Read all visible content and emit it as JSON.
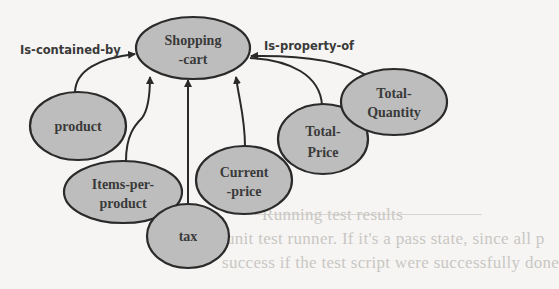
{
  "diagram": {
    "type": "concept-relationship-graph",
    "colors": {
      "node_fill": "#bdbdbd",
      "node_stroke": "#2a2a2a",
      "edge": "#2a2a2a",
      "text": "#3a3a3a",
      "background": "#f6f5f3"
    },
    "nodes": [
      {
        "id": "shopping-cart",
        "lines": [
          "Shopping",
          "-cart"
        ]
      },
      {
        "id": "product",
        "lines": [
          "product"
        ]
      },
      {
        "id": "items-per-product",
        "lines": [
          "Items-per-",
          "product"
        ]
      },
      {
        "id": "tax",
        "lines": [
          "tax"
        ]
      },
      {
        "id": "current-price",
        "lines": [
          "Current",
          "-price"
        ]
      },
      {
        "id": "total-price",
        "lines": [
          "Total-",
          "Price"
        ]
      },
      {
        "id": "total-quantity",
        "lines": [
          "Total-",
          "Quantity"
        ]
      }
    ],
    "edge_labels": {
      "left": "Is-contained-by",
      "right": "Is-property-of"
    },
    "edges": [
      {
        "from": "product",
        "to": "shopping-cart",
        "label": "Is-contained-by"
      },
      {
        "from": "items-per-product",
        "to": "shopping-cart"
      },
      {
        "from": "tax",
        "to": "shopping-cart"
      },
      {
        "from": "current-price",
        "to": "shopping-cart"
      },
      {
        "from": "total-price",
        "to": "shopping-cart",
        "label": "Is-property-of"
      },
      {
        "from": "total-quantity",
        "to": "shopping-cart",
        "label": "Is-property-of"
      }
    ]
  },
  "background_bleed_text": [
    "Running test results",
    "unit test runner. If it's a pass state, since all p",
    "success if the test script were successfully done"
  ]
}
